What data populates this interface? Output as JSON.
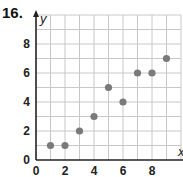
{
  "problem_number": "16.",
  "colors": {
    "grid": "#c8c8c8",
    "axis": "#222222",
    "point": "#7a7a7a"
  },
  "chart_data": {
    "type": "scatter",
    "title": "",
    "xlabel": "x",
    "ylabel": "y",
    "xlim": [
      0,
      10
    ],
    "ylim": [
      0,
      10
    ],
    "grid": true,
    "legend": null,
    "x_tick_labels": [
      "0",
      "2",
      "4",
      "6",
      "8"
    ],
    "y_tick_labels": [
      "0",
      "2",
      "4",
      "6",
      "8"
    ],
    "points": [
      {
        "x": 1,
        "y": 1
      },
      {
        "x": 2,
        "y": 1
      },
      {
        "x": 3,
        "y": 2
      },
      {
        "x": 4,
        "y": 3
      },
      {
        "x": 5,
        "y": 5
      },
      {
        "x": 6,
        "y": 4
      },
      {
        "x": 7,
        "y": 6
      },
      {
        "x": 8,
        "y": 6
      },
      {
        "x": 9,
        "y": 7
      }
    ]
  }
}
